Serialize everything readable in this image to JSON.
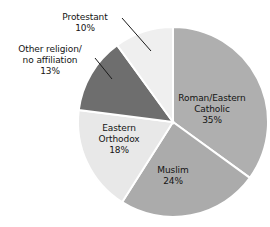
{
  "chart_data": {
    "type": "pie",
    "title": "",
    "subtitle": "",
    "xlabel": "",
    "ylabel": "",
    "legend_position": "none",
    "grid": false,
    "units": "percent",
    "start_angle_deg": 0,
    "direction": "clockwise",
    "categories": [
      "Roman/Eastern Catholic",
      "Muslim",
      "Eastern Orthodox",
      "Other religion/ no affiliation",
      "Protestant"
    ],
    "values": [
      35,
      24,
      18,
      13,
      10
    ],
    "slices": [
      {
        "name_line1": "Roman/Eastern",
        "name_line2": "Catholic",
        "percent_label": "35%",
        "value": 35,
        "color": "#afafaf",
        "label_placement": "inside"
      },
      {
        "name_line1": "Muslim",
        "name_line2": "",
        "percent_label": "24%",
        "value": 24,
        "color": "#ababab",
        "label_placement": "inside"
      },
      {
        "name_line1": "Eastern",
        "name_line2": "Orthodox",
        "percent_label": "18%",
        "value": 18,
        "color": "#e8e8e8",
        "label_placement": "inside"
      },
      {
        "name_line1": "Other religion/",
        "name_line2": "no affiliation",
        "percent_label": "13%",
        "value": 13,
        "color": "#6e6e6e",
        "label_placement": "outside"
      },
      {
        "name_line1": "Protestant",
        "name_line2": "",
        "percent_label": "10%",
        "value": 10,
        "color": "#efefef",
        "label_placement": "outside"
      }
    ]
  },
  "labels": {
    "roman": {
      "line1": "Roman/Eastern",
      "line2": "Catholic",
      "percent": "35%"
    },
    "muslim": {
      "line1": "Muslim",
      "percent": "24%"
    },
    "orthodox": {
      "line1": "Eastern",
      "line2": "Orthodox",
      "percent": "18%"
    },
    "other": {
      "line1": "Other religion/",
      "line2": "no affiliation",
      "percent": "13%"
    },
    "protestant": {
      "line1": "Protestant",
      "percent": "10%"
    }
  },
  "style": {
    "background": "#ffffff",
    "text_color": "#141414",
    "separator_color": "#ffffff",
    "leader_line_color": "#1a1a1a"
  }
}
